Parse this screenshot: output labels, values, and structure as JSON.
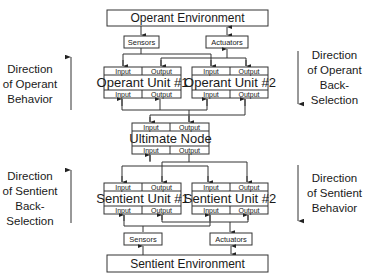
{
  "operant_environment": {
    "label": "Operant Environment"
  },
  "operant_sensors": {
    "label": "Sensors"
  },
  "operant_actuators": {
    "label": "Actuators"
  },
  "operant_unit_1": {
    "label": "Operant Unit #1",
    "top_left": "Input",
    "top_right": "Output",
    "bottom_left": "Input",
    "bottom_right": "Output"
  },
  "operant_unit_2": {
    "label": "Operant Unit #2",
    "top_left": "Input",
    "top_right": "Output",
    "bottom_left": "Input",
    "bottom_right": "Output"
  },
  "ultimate_node": {
    "label": "Ultimate Node",
    "top_left": "Input",
    "top_right": "Output",
    "bottom_left": "Input",
    "bottom_right": "Output"
  },
  "sentient_unit_1": {
    "label": "Sentient Unit #1",
    "top_left": "Input",
    "top_right": "Output",
    "bottom_left": "Input",
    "bottom_right": "Output"
  },
  "sentient_unit_2": {
    "label": "Sentient Unit #2",
    "top_left": "Input",
    "top_right": "Output",
    "bottom_left": "Input",
    "bottom_right": "Output"
  },
  "sentient_sensors": {
    "label": "Sensors"
  },
  "sentient_actuators": {
    "label": "Actuators"
  },
  "sentient_environment": {
    "label": "Sentient Environment"
  },
  "side_labels": {
    "operant_behavior": [
      "Direction",
      "of Operant",
      "Behavior"
    ],
    "operant_back_selection": [
      "Direction",
      "of Operant",
      "Back-",
      "Selection"
    ],
    "sentient_back_selection": [
      "Direction",
      "of Sentient",
      "Back-",
      "Selection"
    ],
    "sentient_behavior": [
      "Direction",
      "of Sentient",
      "Behavior"
    ]
  },
  "arrows": {
    "operant_behavior": "up",
    "operant_back_selection": "down",
    "sentient_back_selection": "up",
    "sentient_behavior": "down"
  }
}
